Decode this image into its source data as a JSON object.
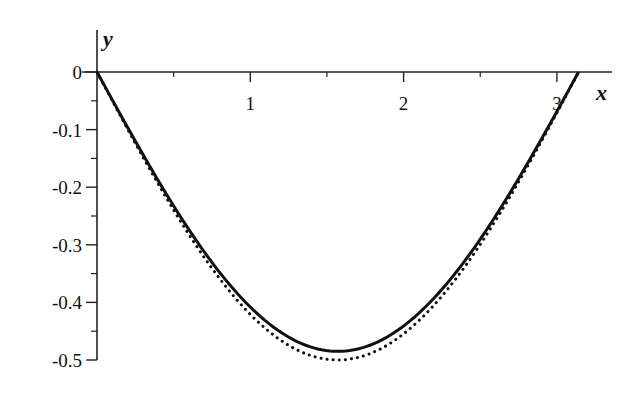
{
  "chart_data": {
    "type": "line",
    "title": "",
    "xlabel": "x",
    "ylabel": "y",
    "xlim": [
      0,
      3.1416
    ],
    "ylim": [
      -0.5,
      0
    ],
    "grid": false,
    "legend": null,
    "x_ticks": [
      {
        "value": 1,
        "label": "1"
      },
      {
        "value": 2,
        "label": "2"
      },
      {
        "value": 3,
        "label": "3"
      }
    ],
    "x_minor_ticks": [
      0.5,
      1.5,
      2.5
    ],
    "y_ticks": [
      {
        "value": 0,
        "label": "0"
      },
      {
        "value": -0.1,
        "label": "-0.1"
      },
      {
        "value": -0.2,
        "label": "-0.2"
      },
      {
        "value": -0.3,
        "label": "-0.3"
      },
      {
        "value": -0.4,
        "label": "-0.4"
      },
      {
        "value": -0.5,
        "label": "-0.5"
      }
    ],
    "y_minor_ticks": [
      -0.05,
      -0.15,
      -0.25,
      -0.35,
      -0.45
    ],
    "series": [
      {
        "name": "solid",
        "style": "solid",
        "color": "#111111",
        "formula_approx": "-0.485*sin(x)",
        "x": [
          0,
          0.3927,
          0.7854,
          1.1781,
          1.5708,
          1.9635,
          2.3562,
          2.7489,
          3.1416
        ],
        "values": [
          0,
          -0.186,
          -0.343,
          -0.448,
          -0.485,
          -0.448,
          -0.343,
          -0.186,
          0
        ]
      },
      {
        "name": "dotted",
        "style": "dotted",
        "color": "#111111",
        "formula_approx": "-0.5*sin(x)",
        "x": [
          0,
          0.3927,
          0.7854,
          1.1781,
          1.5708,
          1.9635,
          2.3562,
          2.7489,
          3.1416
        ],
        "values": [
          0,
          -0.191,
          -0.354,
          -0.462,
          -0.5,
          -0.462,
          -0.354,
          -0.191,
          0
        ]
      }
    ]
  }
}
